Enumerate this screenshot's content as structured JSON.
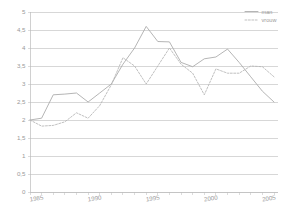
{
  "chart_data": {
    "type": "line",
    "title": "",
    "xlabel": "",
    "ylabel": "",
    "xlim": [
      1985,
      2006
    ],
    "ylim": [
      0,
      5
    ],
    "grid": true,
    "legend_position": "top-right",
    "y_ticks": [
      "0",
      "0,5",
      "1",
      "1,5",
      "2",
      "2,5",
      "3",
      "3,5",
      "4",
      "4,5",
      "5"
    ],
    "y_tick_values": [
      0,
      0.5,
      1,
      1.5,
      2,
      2.5,
      3,
      3.5,
      4,
      4.5,
      5
    ],
    "x_ticks": [
      "1985",
      "1990",
      "1995",
      "2000",
      "2005"
    ],
    "x_tick_values": [
      1985,
      1990,
      1995,
      2000,
      2005
    ],
    "x": [
      1985,
      1986,
      1987,
      1988,
      1989,
      1990,
      1991,
      1992,
      1993,
      1994,
      1995,
      1996,
      1997,
      1998,
      1999,
      2000,
      2001,
      2002,
      2003,
      2004,
      2005,
      2006
    ],
    "series": [
      {
        "name": "man",
        "style": "solid",
        "color": "#a8a8a8",
        "values": [
          2.0,
          2.05,
          2.7,
          2.72,
          2.75,
          2.5,
          2.75,
          3.0,
          3.55,
          4.0,
          4.6,
          4.18,
          4.17,
          3.6,
          3.48,
          3.7,
          3.75,
          3.97,
          3.6,
          3.2,
          2.8,
          2.5
        ]
      },
      {
        "name": "vrouw",
        "style": "dashed",
        "color": "#b5b5b5",
        "values": [
          2.0,
          1.83,
          1.85,
          1.95,
          2.2,
          2.05,
          2.4,
          2.98,
          3.73,
          3.5,
          3.0,
          3.5,
          4.0,
          3.55,
          3.3,
          2.7,
          3.42,
          3.3,
          3.3,
          3.5,
          3.48,
          3.2
        ]
      }
    ]
  },
  "legend": {
    "items": [
      {
        "label": "man",
        "style": "solid"
      },
      {
        "label": "vrouw",
        "style": "dashed"
      }
    ]
  }
}
